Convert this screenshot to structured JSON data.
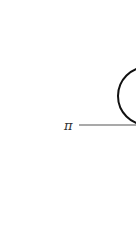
{
  "diagram": {
    "plane_label": "π",
    "colors": {
      "stroke": "#111111",
      "line": "#555555",
      "label": "#333333",
      "background": "#ffffff"
    }
  }
}
